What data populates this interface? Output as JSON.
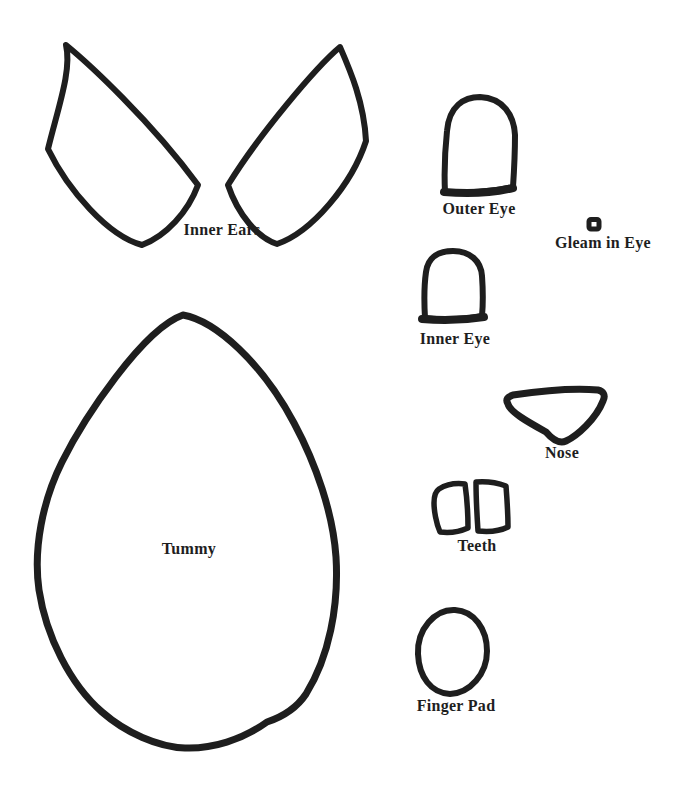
{
  "colors": {
    "ink": "#1e1e1e",
    "paper": "#ffffff"
  },
  "pieces": {
    "inner_ears": {
      "label": "Inner Ears"
    },
    "outer_eye": {
      "label": "Outer Eye"
    },
    "gleam_in_eye": {
      "label": "Gleam in Eye"
    },
    "inner_eye": {
      "label": "Inner Eye"
    },
    "nose": {
      "label": "Nose"
    },
    "teeth": {
      "label": "Teeth"
    },
    "tummy": {
      "label": "Tummy"
    },
    "finger_pad": {
      "label": "Finger Pad"
    }
  }
}
